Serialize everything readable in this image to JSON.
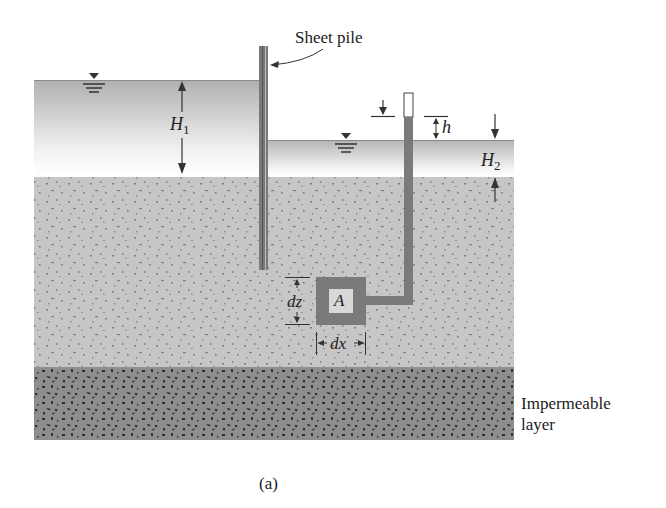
{
  "figure": {
    "caption": "(a)",
    "labels": {
      "sheet_pile": "Sheet pile",
      "h1_main": "H",
      "h1_sub": "1",
      "h2_main": "H",
      "h2_sub": "2",
      "h": "h",
      "dz": "dz",
      "dx": "dx",
      "element": "A",
      "impermeable_line1": "Impermeable",
      "impermeable_line2": "layer"
    },
    "colors": {
      "water_top": "#b4b4b4",
      "water_bottom": "#ffffff",
      "soil": "#c4c4c4",
      "impermeable": "#8c8c8c",
      "pile": "#6e6e6e",
      "tube": "#7a7a7a",
      "lines": "#333333"
    }
  }
}
